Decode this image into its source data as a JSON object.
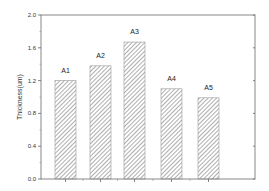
{
  "chart_data": {
    "type": "bar",
    "title": "",
    "xlabel": "",
    "ylabel": "Thickness(um)",
    "categories": [
      "A1",
      "A2",
      "A3",
      "A4",
      "A5"
    ],
    "values": [
      1.2,
      1.38,
      1.67,
      1.1,
      0.99
    ],
    "ylim": [
      0.0,
      2.0
    ],
    "yticks": [
      "0.0",
      "0.4",
      "0.8",
      "1.2",
      "1.6",
      "2.0"
    ],
    "bar_fill": "diagonal-hatch",
    "grid": false,
    "legend": null
  }
}
